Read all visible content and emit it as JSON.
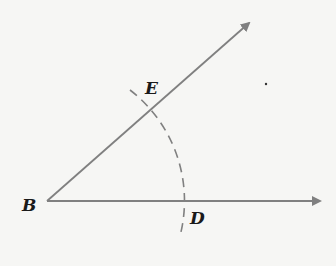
{
  "diagram": {
    "type": "angle-construction",
    "points": {
      "B": {
        "label": "B",
        "x": 47,
        "y": 201
      },
      "E": {
        "label": "E",
        "x": 151,
        "y": 110
      },
      "D": {
        "label": "D",
        "x": 184,
        "y": 201
      }
    },
    "rays": [
      {
        "from": "B",
        "to": [
          322,
          201
        ],
        "arrow": true
      },
      {
        "from": "B",
        "to": [
          251,
          22
        ],
        "arrow": true
      }
    ],
    "arc": {
      "center": "B",
      "style": "dashed",
      "through": [
        "E",
        "D"
      ]
    },
    "colors": {
      "line": "#808080",
      "label": "#1a1a1a"
    }
  }
}
